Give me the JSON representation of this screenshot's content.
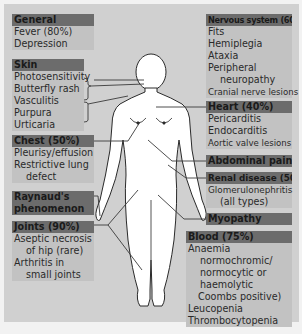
{
  "diagram": {
    "type": "anatomical-callout",
    "colors": {
      "background": "#d0d0d0",
      "box_fill": "#c2c2c2",
      "header_fill": "#6c6c6c",
      "body_fill": "#ffffff",
      "line": "#3a3a3a"
    }
  },
  "left": {
    "general": {
      "header": "General",
      "items": [
        "Fever (80%)",
        "Depression"
      ]
    },
    "skin": {
      "header": "Skin",
      "items": [
        "Photosensitivity",
        "Butterfly rash",
        "Vasculitis",
        "Purpura",
        "Urticaria"
      ]
    },
    "chest": {
      "header": "Chest (50%)",
      "items": [
        "Pleurisy/effusion",
        "Restrictive lung",
        "defect"
      ]
    },
    "raynauds": {
      "header_line1": "Raynaud's",
      "header_line2": "phenomenon"
    },
    "joints": {
      "header": "Joints (90%)",
      "items": [
        "Aseptic necrosis",
        "of hip (rare)",
        "Arthritis in",
        "small joints"
      ]
    }
  },
  "right": {
    "nervous": {
      "header": "Nervous system (60%)",
      "items": [
        "Fits",
        "Hemiplegia",
        "Ataxia",
        "Peripheral",
        "neuropathy",
        "Cranial nerve lesions"
      ]
    },
    "heart": {
      "header": "Heart (40%)",
      "items": [
        "Pericarditis",
        "Endocarditis",
        "Aortic valve lesions"
      ]
    },
    "abdominal": {
      "header": "Abdominal pain"
    },
    "renal": {
      "header": "Renal disease (50%)",
      "items": [
        "Glomerulonephritis",
        "(all types)"
      ]
    },
    "myopathy": {
      "header": "Myopathy"
    },
    "blood": {
      "header": "Blood (75%)",
      "items": [
        "Anaemia",
        "normochromic/",
        "normocytic or",
        "haemolytic",
        "Coombs positive)",
        "Leucopenia",
        "Thrombocytopenia"
      ]
    }
  }
}
